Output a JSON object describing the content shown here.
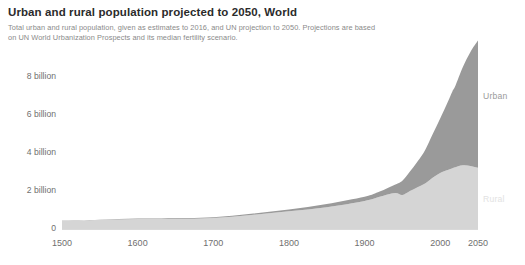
{
  "chart_data": {
    "type": "area",
    "stacked": true,
    "title": "Urban and rural population projected to 2050, World",
    "subtitle_line1": "Total urban and rural population, given as estimates to 2016, and UN projection to 2050. Projections are based",
    "subtitle_line2": "on UN World Urbanization Prospects and its median fertility scenario.",
    "xlabel": "",
    "ylabel": "",
    "xlim": [
      1500,
      2050
    ],
    "ylim": [
      0,
      10400000000
    ],
    "grid": false,
    "legend_position": "right-inline",
    "x_tick_labels": [
      "1500",
      "1600",
      "1700",
      "1800",
      "1900",
      "2000",
      "2050"
    ],
    "x_ticks": [
      1500,
      1600,
      1700,
      1800,
      1900,
      2000,
      2050
    ],
    "y_tick_labels": [
      "0",
      "2 billion",
      "4 billion",
      "6 billion",
      "8 billion"
    ],
    "y_ticks": [
      0,
      2000000000,
      4000000000,
      6000000000,
      8000000000
    ],
    "colors": {
      "urban": "#9a9a9a",
      "rural": "#d5d5d5",
      "axis_text": "#6f6f6f",
      "title": "#2b2b2b",
      "subtitle": "#8a8a8a"
    },
    "x": [
      1500,
      1550,
      1600,
      1650,
      1700,
      1750,
      1800,
      1850,
      1900,
      1920,
      1940,
      1950,
      1960,
      1970,
      1980,
      1990,
      2000,
      2010,
      2016,
      2020,
      2030,
      2040,
      2050
    ],
    "series": [
      {
        "name": "Rural",
        "color": "#d5d5d5",
        "label": "Rural",
        "values": [
          430000000,
          470000000,
          525000000,
          530000000,
          580000000,
          740000000,
          930000000,
          1150000000,
          1480000000,
          1700000000,
          1900000000,
          1790000000,
          2000000000,
          2200000000,
          2400000000,
          2700000000,
          2950000000,
          3100000000,
          3200000000,
          3250000000,
          3350000000,
          3320000000,
          3220000000
        ]
      },
      {
        "name": "Urban",
        "color": "#9a9a9a",
        "label": "Urban",
        "values": [
          15000000,
          20000000,
          25000000,
          30000000,
          40000000,
          60000000,
          90000000,
          170000000,
          220000000,
          270000000,
          430000000,
          750000000,
          1020000000,
          1350000000,
          1750000000,
          2290000000,
          2870000000,
          3590000000,
          4030000000,
          4270000000,
          5170000000,
          6000000000,
          6700000000
        ]
      }
    ]
  }
}
